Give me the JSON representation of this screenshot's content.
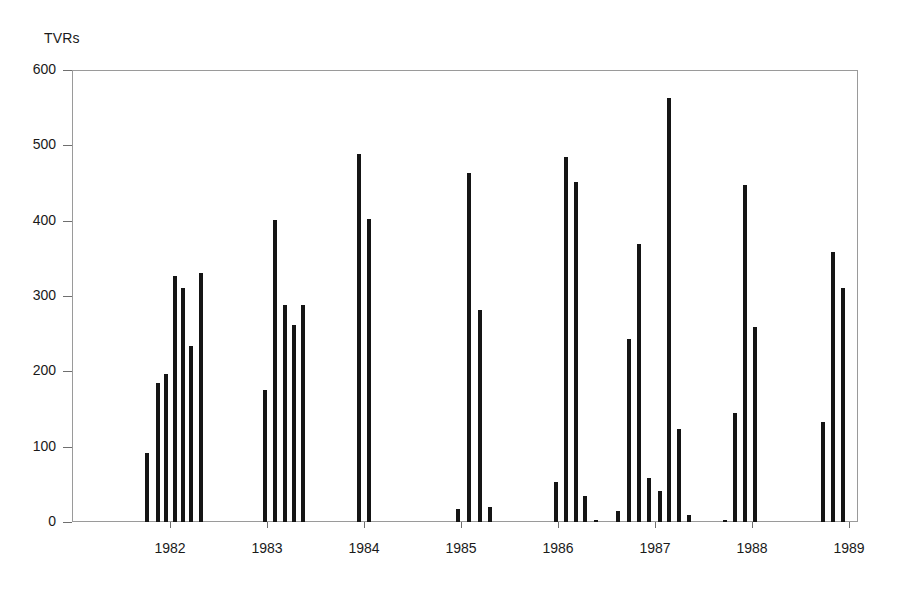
{
  "chart_data": {
    "type": "bar",
    "title": "",
    "ylabel": "TVRs",
    "xlabel": "",
    "ylim": [
      0,
      600
    ],
    "ytick_labels": [
      "600",
      "500",
      "400",
      "300",
      "200",
      "100",
      "0"
    ],
    "ytick_values": [
      600,
      500,
      400,
      300,
      200,
      100,
      0
    ],
    "xtick_labels": [
      "1982",
      "1983",
      "1984",
      "1985",
      "1986",
      "1987",
      "1988",
      "1989"
    ],
    "grid": false,
    "legend": null,
    "groups": [
      {
        "label": "1982",
        "values": [
          91,
          185,
          197,
          327,
          311,
          234,
          331
        ]
      },
      {
        "label": "1983",
        "values": [
          175,
          401,
          288,
          261,
          288
        ]
      },
      {
        "label": "1984",
        "values": [
          489,
          402
        ]
      },
      {
        "label": "1985",
        "values": [
          17,
          463,
          281,
          20
        ]
      },
      {
        "label": "1986",
        "values": [
          53,
          484,
          452,
          34,
          3
        ]
      },
      {
        "label": "1987",
        "values": [
          15,
          243,
          369,
          58,
          41,
          563,
          124,
          9
        ]
      },
      {
        "label": "1988",
        "values": [
          3,
          145,
          448,
          259
        ]
      },
      {
        "label": "1989",
        "values": [
          133,
          358,
          311
        ]
      }
    ],
    "bars": [
      {
        "x": 145,
        "value": 91
      },
      {
        "x": 156,
        "value": 185
      },
      {
        "x": 164,
        "value": 197
      },
      {
        "x": 173,
        "value": 327
      },
      {
        "x": 181,
        "value": 311
      },
      {
        "x": 189,
        "value": 234
      },
      {
        "x": 199,
        "value": 331
      },
      {
        "x": 263,
        "value": 175
      },
      {
        "x": 273,
        "value": 401
      },
      {
        "x": 283,
        "value": 288
      },
      {
        "x": 292,
        "value": 261
      },
      {
        "x": 301,
        "value": 288
      },
      {
        "x": 357,
        "value": 489
      },
      {
        "x": 367,
        "value": 402
      },
      {
        "x": 456,
        "value": 17
      },
      {
        "x": 467,
        "value": 463
      },
      {
        "x": 478,
        "value": 281
      },
      {
        "x": 488,
        "value": 20
      },
      {
        "x": 554,
        "value": 53
      },
      {
        "x": 564,
        "value": 484
      },
      {
        "x": 574,
        "value": 452
      },
      {
        "x": 583,
        "value": 34
      },
      {
        "x": 594,
        "value": 3
      },
      {
        "x": 616,
        "value": 15
      },
      {
        "x": 627,
        "value": 243
      },
      {
        "x": 637,
        "value": 369
      },
      {
        "x": 647,
        "value": 58
      },
      {
        "x": 658,
        "value": 41
      },
      {
        "x": 667,
        "value": 563
      },
      {
        "x": 677,
        "value": 124
      },
      {
        "x": 687,
        "value": 9
      },
      {
        "x": 723,
        "value": 3
      },
      {
        "x": 733,
        "value": 145
      },
      {
        "x": 743,
        "value": 448
      },
      {
        "x": 753,
        "value": 259
      },
      {
        "x": 821,
        "value": 133
      },
      {
        "x": 831,
        "value": 358
      },
      {
        "x": 841,
        "value": 311
      }
    ],
    "xtick_positions": [
      170,
      267,
      364,
      461,
      558,
      655,
      752,
      849
    ],
    "colors": {
      "bar": "#151515",
      "axis": "#9a9a9a",
      "text": "#1a1a1a"
    }
  }
}
